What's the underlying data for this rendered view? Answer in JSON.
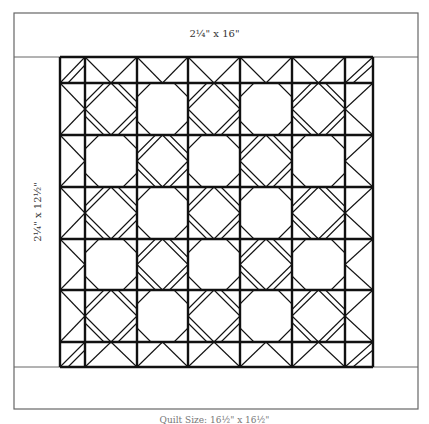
{
  "labels": {
    "top_border": "2¼\" x 16\"",
    "side_border": "2¼\" x 12½\"",
    "bottom_caption": "Quilt Size: 16½\" x 16½\""
  },
  "colors": {
    "line": "#111111",
    "frame": "#666666",
    "background": "#ffffff"
  },
  "frame": {
    "x": 14,
    "y": 13,
    "width": 404,
    "height": 396,
    "top_divider_y": 57,
    "bottom_divider_y": 367,
    "left_divider_x": 60,
    "right_divider_x": 373
  },
  "quilt": {
    "grid_x": [
      60,
      85,
      137,
      188,
      240,
      292,
      345,
      373
    ],
    "grid_y": [
      57,
      83,
      135,
      187,
      239,
      290,
      342,
      367
    ],
    "block_pattern": "checkerboard: diamond-with-double-corners / octagon",
    "blocks_per_side": 5
  }
}
